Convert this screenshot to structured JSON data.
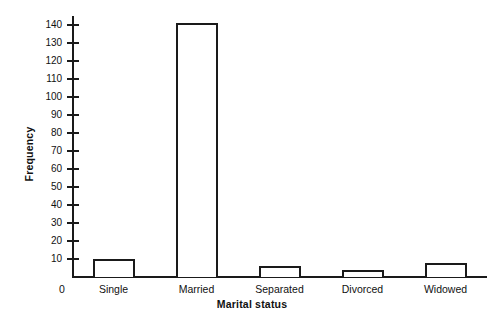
{
  "chart_data": {
    "type": "bar",
    "title": "",
    "xlabel": "Marital status",
    "ylabel": "Frequency",
    "categories": [
      "Single",
      "Married",
      "Separated",
      "Divorced",
      "Widowed"
    ],
    "values": [
      10,
      141,
      6,
      4,
      8
    ],
    "ytick_labels": [
      "10",
      "20",
      "30",
      "40",
      "50",
      "60",
      "70",
      "80",
      "90",
      "100",
      "110",
      "120",
      "130",
      "140"
    ],
    "ytick_values": [
      10,
      20,
      30,
      40,
      50,
      60,
      70,
      80,
      90,
      100,
      110,
      120,
      130,
      140
    ],
    "ylim": [
      0,
      145
    ],
    "origin_label": "0",
    "grid": false,
    "legend": false,
    "bar_fill_color": "#ffffff",
    "bar_edge_color": "#1a1a1a",
    "axis_color": "#1a1a1a",
    "background_color": "#ffffff"
  }
}
